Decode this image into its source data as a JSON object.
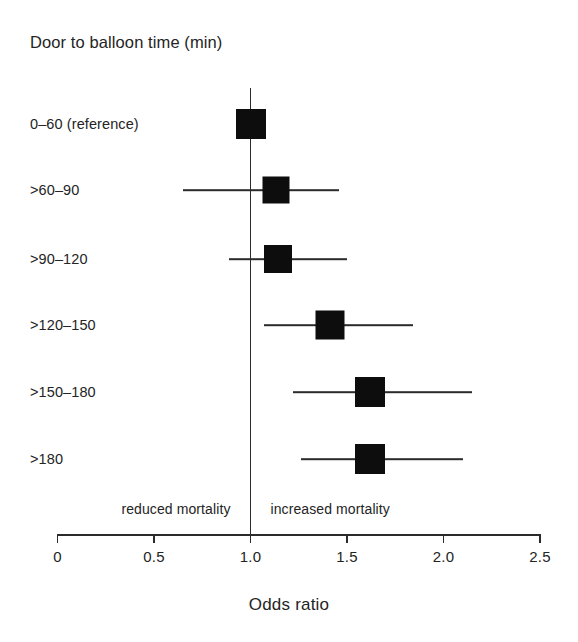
{
  "figure": {
    "title": "Door to balloon time (min)",
    "axis_title": "Odds ratio",
    "note_left": "reduced mortality",
    "note_right": "increased mortality"
  },
  "chart_data": {
    "type": "scatter",
    "subtype": "forest-plot",
    "title": "Door to balloon time (min)",
    "xlabel": "Odds ratio",
    "ylabel": "",
    "xlim": [
      0,
      2.5
    ],
    "xticks": [
      0,
      0.5,
      1.0,
      1.5,
      2.0,
      2.5
    ],
    "xticklabels": [
      "0",
      "0.5",
      "1.0",
      "1.5",
      "2.0",
      "2.5"
    ],
    "grid": false,
    "legend": false,
    "reference_line": 1.0,
    "annotations": [
      {
        "text": "reduced mortality",
        "x": 0.5,
        "side": "left"
      },
      {
        "text": "increased mortality",
        "x": 1.5,
        "side": "right"
      }
    ],
    "categories": [
      "0–60 (reference)",
      ">60–90",
      ">90–120",
      ">120–150",
      ">150–180",
      ">180"
    ],
    "values": [
      1.0,
      1.13,
      1.14,
      1.41,
      1.62,
      1.62
    ],
    "ci_low": [
      null,
      0.65,
      0.89,
      1.07,
      1.22,
      1.26
    ],
    "ci_high": [
      null,
      1.46,
      1.5,
      1.84,
      2.15,
      2.1
    ],
    "points": [
      {
        "category": "0–60 (reference)",
        "odds_ratio": 1.0,
        "ci_low": null,
        "ci_high": null,
        "marker_size": 30
      },
      {
        "category": ">60–90",
        "odds_ratio": 1.13,
        "ci_low": 0.65,
        "ci_high": 1.46,
        "marker_size": 27
      },
      {
        "category": ">90–120",
        "odds_ratio": 1.14,
        "ci_low": 0.89,
        "ci_high": 1.5,
        "marker_size": 28
      },
      {
        "category": ">120–150",
        "odds_ratio": 1.41,
        "ci_low": 1.07,
        "ci_high": 1.84,
        "marker_size": 29
      },
      {
        "category": ">150–180",
        "odds_ratio": 1.62,
        "ci_low": 1.22,
        "ci_high": 2.15,
        "marker_size": 30
      },
      {
        "category": ">180",
        "odds_ratio": 1.62,
        "ci_low": 1.26,
        "ci_high": 2.1,
        "marker_size": 30
      }
    ],
    "colors": {
      "marker": "#0d0d0d",
      "line": "#2b2b2b",
      "text": "#242424",
      "background": "#ffffff"
    }
  },
  "geometry": {
    "x_at_zero_px": 57.5,
    "px_per_unit": 193,
    "row_y_px": [
      124,
      190,
      259,
      325,
      392,
      459
    ],
    "axis_y_px": 534,
    "ref_line_top_px": 88,
    "ref_line_bottom_px": 534
  }
}
